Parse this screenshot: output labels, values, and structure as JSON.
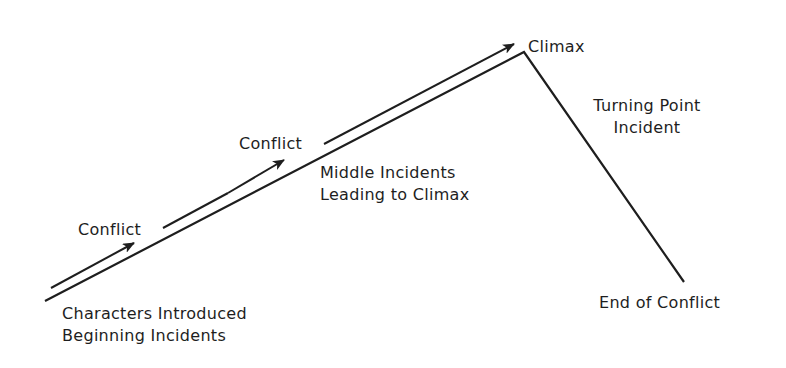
{
  "diagram": {
    "type": "plot-structure-line",
    "stroke_color": "#1e1e1e",
    "labels": {
      "conflict_1": "Conflict",
      "conflict_2": "Conflict",
      "climax": "Climax",
      "middle_line1": "Middle Incidents",
      "middle_line2": "Leading to Climax",
      "turning_line1": "Turning Point",
      "turning_line2": "Incident",
      "beginning_line1": "Characters Introduced",
      "beginning_line2": "Beginning Incidents",
      "end": "End of Conflict"
    }
  }
}
